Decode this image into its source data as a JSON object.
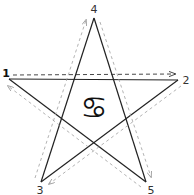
{
  "diagram": {
    "title": "",
    "symbol": {
      "name": "cancer-zodiac",
      "glyph": "♋"
    },
    "points": [
      {
        "id": "1",
        "label": "1",
        "x": 9,
        "y": 79,
        "lx": 6,
        "ly": 73
      },
      {
        "id": "2",
        "label": "2",
        "x": 178,
        "y": 80,
        "lx": 186,
        "ly": 80
      },
      {
        "id": "3",
        "label": "3",
        "x": 41,
        "y": 182,
        "lx": 40,
        "ly": 190
      },
      {
        "id": "4",
        "label": "4",
        "x": 94,
        "y": 18,
        "lx": 94,
        "ly": 9
      },
      {
        "id": "5",
        "label": "5",
        "x": 146,
        "y": 182,
        "lx": 151,
        "ly": 190
      }
    ],
    "star_edges": [
      [
        "1",
        "2"
      ],
      [
        "2",
        "3"
      ],
      [
        "3",
        "4"
      ],
      [
        "4",
        "5"
      ],
      [
        "5",
        "1"
      ]
    ],
    "arrow_sequence": [
      "1",
      "2",
      "3",
      "4",
      "5",
      "1"
    ],
    "colors": {
      "star_line": "#222222",
      "arrow_primary": "#333333",
      "arrow_secondary": "#a0a0a0",
      "background": "#ffffff"
    }
  }
}
